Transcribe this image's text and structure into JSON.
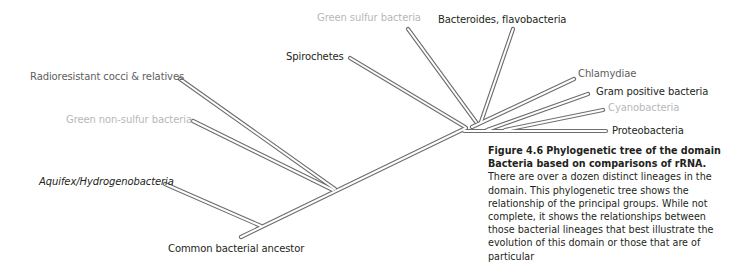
{
  "figure": {
    "number": "Figure 4.6",
    "title": "Phylogenetic tree of the domain Bacteria based on comparisons of rRNA.",
    "body": "There are over a dozen distinct lineages in the domain. This phylogenetic tree shows the relationship of the principal groups. While not complete, it shows the relationships between those bacterial lineages that best illustrate the evolution of this domain or those that are of particular"
  },
  "tree": {
    "root_label": "Common bacterial ancestor",
    "lineages": [
      {
        "id": "green-sulfur",
        "label": "Green sulfur bacteria",
        "tone": "light"
      },
      {
        "id": "bacteroides",
        "label": "Bacteroides, flavobacteria",
        "tone": "dark"
      },
      {
        "id": "spirochetes",
        "label": "Spirochetes",
        "tone": "dark"
      },
      {
        "id": "radioresistant",
        "label": "Radioresistant cocci & relatives",
        "tone": "gray"
      },
      {
        "id": "chlamydiae",
        "label": "Chlamydiae",
        "tone": "gray"
      },
      {
        "id": "gram-positive",
        "label": "Gram positive bacteria",
        "tone": "dark"
      },
      {
        "id": "cyanobacteria",
        "label": "Cyanobacteria",
        "tone": "light"
      },
      {
        "id": "proteobacteria",
        "label": "Proteobacteria",
        "tone": "dark"
      },
      {
        "id": "green-non-sulfur",
        "label": "Green non-sulfur bacteria",
        "tone": "light"
      },
      {
        "id": "aquifex",
        "label": "Aquifex/Hydrogenobacteria",
        "tone": "dark",
        "italic": true
      }
    ]
  },
  "colors": {
    "dark_text": "#231f20",
    "gray_text": "#5e5e60",
    "light_text": "#b7b8ba",
    "branch_outline": "#6d6e71",
    "branch_fill": "#ffffff"
  }
}
